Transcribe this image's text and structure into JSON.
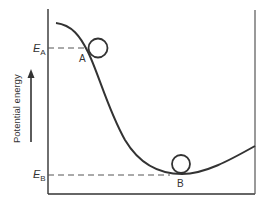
{
  "diagram": {
    "y_axis_label": "Potential energy",
    "levels": {
      "a": {
        "symbol": "E",
        "subscript": "A"
      },
      "b": {
        "symbol": "E",
        "subscript": "B"
      }
    },
    "points": {
      "a": "A",
      "b": "B"
    },
    "colors": {
      "line": "#333333",
      "dashed": "#555555",
      "background": "#ffffff"
    }
  }
}
